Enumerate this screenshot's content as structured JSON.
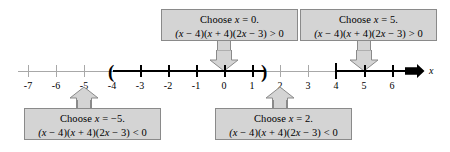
{
  "figure": {
    "type": "number-line-sign-chart",
    "axis_label": "x",
    "tick_labels": [
      "-7",
      "-6",
      "-5",
      "-4",
      "-3",
      "-2",
      "-1",
      "0",
      "1",
      "2",
      "3",
      "4",
      "5",
      "6"
    ],
    "tick_values": [
      -7,
      -6,
      -5,
      -4,
      -3,
      -2,
      -1,
      0,
      1,
      2,
      3,
      4,
      5,
      6
    ],
    "expression": "(x - 4)(x + 4)(2x - 3)",
    "shaded_intervals": [
      {
        "from": "-4",
        "to": "1.5",
        "left_endpoint": "open",
        "right_endpoint": "open"
      },
      {
        "from": "4",
        "to": "6+",
        "left_endpoint": "open",
        "right_endpoint": "arrow"
      }
    ]
  },
  "callouts": {
    "top_left": {
      "name": "choose-x-0",
      "line1_prefix": "Choose ",
      "line1_var": "x",
      "line1_suffix": " = 0.",
      "line2": "(x − 4)(x + 4)(2x − 3) > 0",
      "test_value": "0",
      "sign": ">",
      "pointer": "down",
      "points_to": "0"
    },
    "top_right": {
      "name": "choose-x-5",
      "line1_prefix": "Choose ",
      "line1_var": "x",
      "line1_suffix": " = 5.",
      "line2": "(x − 4)(x + 4)(2x − 3) > 0",
      "test_value": "5",
      "sign": ">",
      "pointer": "down",
      "points_to": "5"
    },
    "bottom_left": {
      "name": "choose-x-minus-5",
      "line1_prefix": "Choose ",
      "line1_var": "x",
      "line1_suffix": " = −5.",
      "line2": "(x − 4)(x + 4)(2x − 3) < 0",
      "test_value": "-5",
      "sign": "<",
      "pointer": "up",
      "points_to": "-5"
    },
    "bottom_right": {
      "name": "choose-x-2",
      "line1_prefix": "Choose ",
      "line1_var": "x",
      "line1_suffix": " = 2.",
      "line2": "(x − 4)(x + 4)(2x − 3) < 0",
      "test_value": "2",
      "sign": "<",
      "pointer": "up",
      "points_to": "2"
    }
  },
  "colors": {
    "box_fill": "#d4d4d4",
    "box_border": "#8a8a8a",
    "axis": "#a8a8a8",
    "bold": "#000000",
    "background": "#ffffff"
  }
}
